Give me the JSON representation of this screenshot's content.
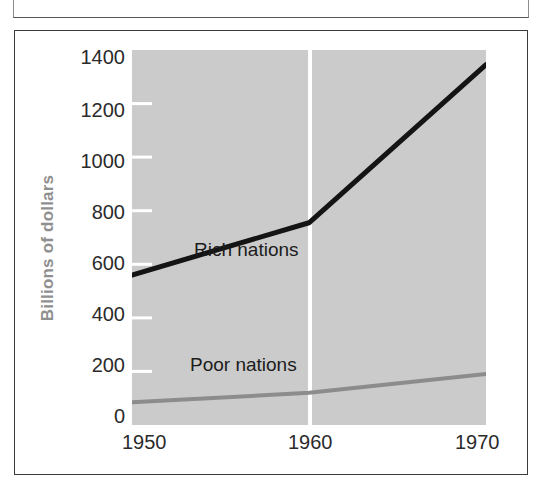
{
  "figure": {
    "background_color": "#ffffff",
    "frame_color": "#3c3c3c",
    "plot_background_color": "#cbcbcb",
    "gridline_color": "#ffffff"
  },
  "axis": {
    "y_title": "Billions of dollars",
    "y_title_color": "#8f8f8f",
    "y_ticks": [
      "1400",
      "1200",
      "1000",
      "800",
      "600",
      "400",
      "200",
      "0"
    ],
    "x_ticks": [
      "1950",
      "1960",
      "1970"
    ]
  },
  "series_labels": {
    "rich": "Rich nations",
    "poor": "Poor nations"
  },
  "chart_data": {
    "type": "line",
    "title": "",
    "subtitle": "",
    "xlabel": "",
    "ylabel": "Billions of dollars",
    "xlim": [
      1950,
      1970
    ],
    "ylim": [
      0,
      1400
    ],
    "x": [
      1950,
      1960,
      1970
    ],
    "xticks": [
      1950,
      1960,
      1970
    ],
    "yticks": [
      0,
      200,
      400,
      600,
      800,
      1000,
      1200,
      1400
    ],
    "grid": "vertical gridline at 1960 only, white",
    "legend": "inline labels placed next to each line inside the plot",
    "series": [
      {
        "name": "Rich nations",
        "color": "#141414",
        "line_width": 5,
        "values": [
          560,
          755,
          1345
        ]
      },
      {
        "name": "Poor nations",
        "color": "#8c8c8c",
        "line_width": 4,
        "values": [
          85,
          120,
          190
        ]
      }
    ],
    "annotations": [
      {
        "text": "Rich nations",
        "x": 1951.6,
        "y": 835
      },
      {
        "text": "Poor nations",
        "x": 1952.0,
        "y": 255
      }
    ]
  }
}
